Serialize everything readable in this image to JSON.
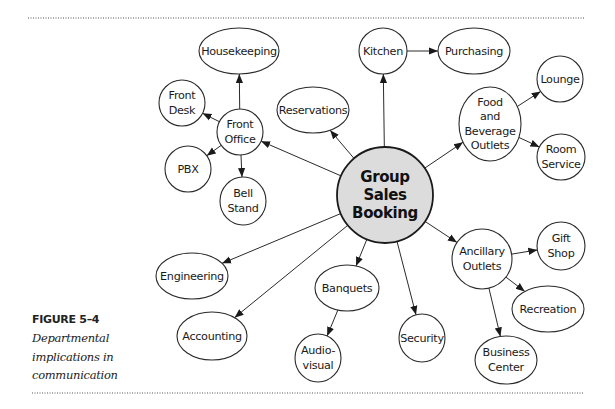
{
  "figure": {
    "label": "FIGURE 5–4",
    "caption_lines": [
      "Departmental",
      "implications in",
      "communication"
    ]
  },
  "colors": {
    "center_fill": "#dcdcdc",
    "node_fill": "#ffffff",
    "stroke": "#2a2a2a"
  },
  "center": {
    "id": "group-sales-booking",
    "lines": [
      "Group",
      "Sales",
      "Booking"
    ],
    "cx": 385,
    "cy": 195,
    "r": 48
  },
  "nodes": [
    {
      "id": "housekeeping",
      "lines": [
        "Housekeeping"
      ],
      "cx": 239,
      "cy": 51,
      "rx": 40,
      "ry": 23
    },
    {
      "id": "front-desk",
      "lines": [
        "Front",
        "Desk"
      ],
      "cx": 182,
      "cy": 103,
      "rx": 23,
      "ry": 23
    },
    {
      "id": "front-office",
      "lines": [
        "Front",
        "Office"
      ],
      "cx": 240,
      "cy": 132,
      "rx": 23,
      "ry": 23
    },
    {
      "id": "pbx",
      "lines": [
        "PBX"
      ],
      "cx": 188,
      "cy": 169,
      "rx": 23,
      "ry": 23
    },
    {
      "id": "bell-stand",
      "lines": [
        "Bell",
        "Stand"
      ],
      "cx": 243,
      "cy": 201,
      "rx": 23,
      "ry": 24
    },
    {
      "id": "reservations",
      "lines": [
        "Reservations"
      ],
      "cx": 313,
      "cy": 110,
      "rx": 36,
      "ry": 23
    },
    {
      "id": "kitchen",
      "lines": [
        "Kitchen"
      ],
      "cx": 383,
      "cy": 51,
      "rx": 24,
      "ry": 23
    },
    {
      "id": "purchasing",
      "lines": [
        "Purchasing"
      ],
      "cx": 474,
      "cy": 51,
      "rx": 36,
      "ry": 23
    },
    {
      "id": "food-and-beverage-outlets",
      "lines": [
        "Food",
        "and",
        "Beverage",
        "Outlets"
      ],
      "cx": 490,
      "cy": 124,
      "rx": 31,
      "ry": 37
    },
    {
      "id": "lounge",
      "lines": [
        "Lounge"
      ],
      "cx": 560,
      "cy": 79,
      "rx": 23,
      "ry": 23
    },
    {
      "id": "room-service",
      "lines": [
        "Room",
        "Service"
      ],
      "cx": 561,
      "cy": 157,
      "rx": 24,
      "ry": 23
    },
    {
      "id": "ancillary-outlets",
      "lines": [
        "Ancillary",
        "Outlets"
      ],
      "cx": 482,
      "cy": 259,
      "rx": 30,
      "ry": 30
    },
    {
      "id": "gift-shop",
      "lines": [
        "Gift",
        "Shop"
      ],
      "cx": 561,
      "cy": 246,
      "rx": 24,
      "ry": 24
    },
    {
      "id": "recreation",
      "lines": [
        "Recreation"
      ],
      "cx": 548,
      "cy": 309,
      "rx": 36,
      "ry": 23
    },
    {
      "id": "business-center",
      "lines": [
        "Business",
        "Center"
      ],
      "cx": 506,
      "cy": 360,
      "rx": 31,
      "ry": 24
    },
    {
      "id": "security",
      "lines": [
        "Security"
      ],
      "cx": 422,
      "cy": 338,
      "rx": 23,
      "ry": 24
    },
    {
      "id": "banquets",
      "lines": [
        "Banquets"
      ],
      "cx": 347,
      "cy": 288,
      "rx": 32,
      "ry": 23
    },
    {
      "id": "audio-visual",
      "lines": [
        "Audio-",
        "visual"
      ],
      "cx": 318,
      "cy": 358,
      "rx": 23,
      "ry": 24
    },
    {
      "id": "engineering",
      "lines": [
        "Engineering"
      ],
      "cx": 192,
      "cy": 276,
      "rx": 36,
      "ry": 23
    },
    {
      "id": "accounting",
      "lines": [
        "Accounting"
      ],
      "cx": 212,
      "cy": 336,
      "rx": 35,
      "ry": 24
    }
  ],
  "edges": [
    {
      "from": "group-sales-booking",
      "to": "front-office"
    },
    {
      "from": "group-sales-booking",
      "to": "reservations"
    },
    {
      "from": "group-sales-booking",
      "to": "kitchen"
    },
    {
      "from": "group-sales-booking",
      "to": "food-and-beverage-outlets"
    },
    {
      "from": "group-sales-booking",
      "to": "ancillary-outlets"
    },
    {
      "from": "group-sales-booking",
      "to": "security"
    },
    {
      "from": "group-sales-booking",
      "to": "banquets"
    },
    {
      "from": "group-sales-booking",
      "to": "engineering"
    },
    {
      "from": "group-sales-booking",
      "to": "accounting"
    },
    {
      "from": "front-office",
      "to": "housekeeping"
    },
    {
      "from": "front-office",
      "to": "front-desk"
    },
    {
      "from": "front-office",
      "to": "pbx"
    },
    {
      "from": "front-office",
      "to": "bell-stand"
    },
    {
      "from": "kitchen",
      "to": "purchasing"
    },
    {
      "from": "food-and-beverage-outlets",
      "to": "lounge"
    },
    {
      "from": "food-and-beverage-outlets",
      "to": "room-service"
    },
    {
      "from": "ancillary-outlets",
      "to": "gift-shop"
    },
    {
      "from": "ancillary-outlets",
      "to": "recreation"
    },
    {
      "from": "ancillary-outlets",
      "to": "business-center"
    },
    {
      "from": "banquets",
      "to": "audio-visual"
    }
  ],
  "rules": {
    "top": {
      "x1": 28,
      "x2": 584,
      "y": 18
    },
    "bottom": {
      "x1": 32,
      "x2": 584,
      "y": 393
    }
  }
}
